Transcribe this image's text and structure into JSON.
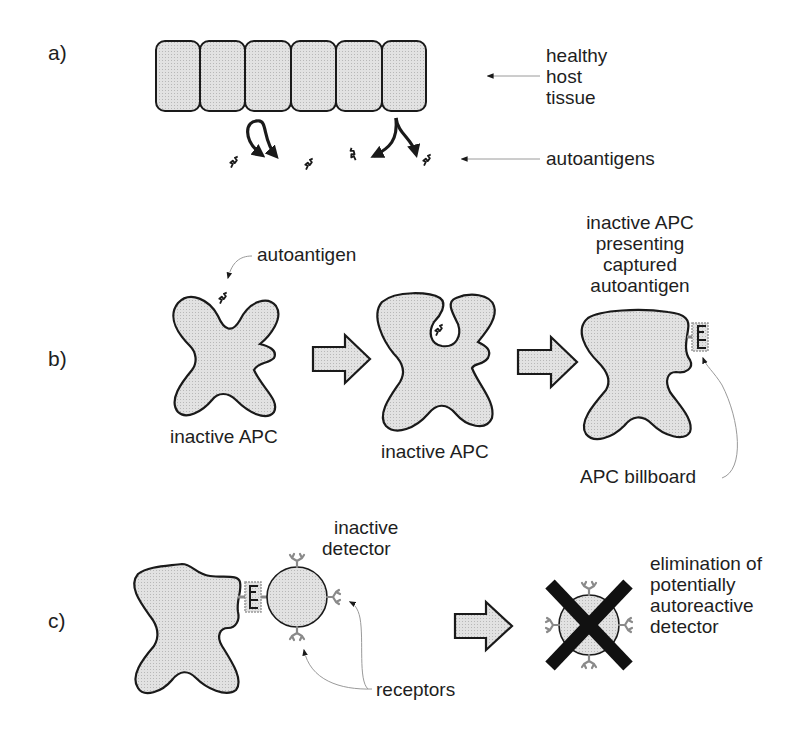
{
  "panels": {
    "a": {
      "label": "a)",
      "tissue_label": [
        "healthy",
        "host",
        "tissue"
      ],
      "antigen_label": "autoantigens",
      "cell_count": 6
    },
    "b": {
      "label": "b)",
      "autoantigen_label": "autoantigen",
      "apc1_label": "inactive APC",
      "apc2_label": "inactive APC",
      "apc3_title": [
        "inactive APC",
        "presenting",
        "captured",
        "autoantigen"
      ],
      "billboard_label": "APC billboard"
    },
    "c": {
      "label": "c)",
      "detector_label": [
        "inactive",
        "detector"
      ],
      "receptors_label": "receptors",
      "elimination_label": [
        "elimination of",
        "potentially",
        "autoreactive",
        "detector"
      ]
    }
  },
  "colors": {
    "fill": "#dcdcdc",
    "stroke": "#1a1a1a",
    "receptor": "#8a8a8a",
    "pointer": "#9a9a9a"
  }
}
